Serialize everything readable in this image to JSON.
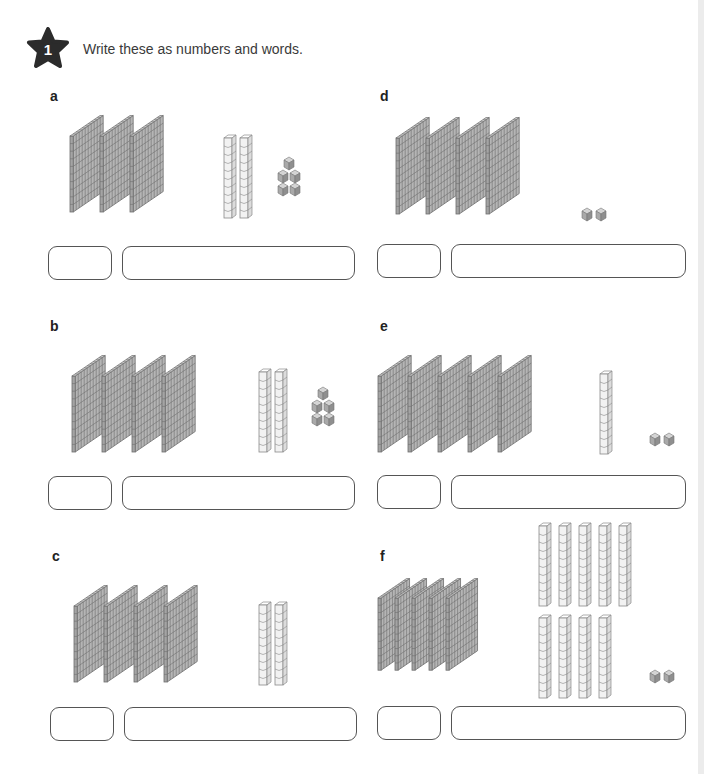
{
  "header": {
    "question_number": "1",
    "instruction": "Write these as numbers and words."
  },
  "colors": {
    "flat_fill": "#b5b5b5",
    "flat_line": "#6e6e6e",
    "rod_fill": "#f2f2f2",
    "rod_line": "#8a8a8a",
    "unit_fill": "#a9a9a9",
    "box_border": "#555555"
  },
  "problems": [
    {
      "id": "a",
      "label": "a",
      "hundreds": 3,
      "tens": 2,
      "ones": 5,
      "number_answer": "",
      "words_answer": ""
    },
    {
      "id": "b",
      "label": "b",
      "hundreds": 4,
      "tens": 2,
      "ones": 5,
      "number_answer": "",
      "words_answer": ""
    },
    {
      "id": "c",
      "label": "c",
      "hundreds": 4,
      "tens": 2,
      "ones": 0,
      "number_answer": "",
      "words_answer": ""
    },
    {
      "id": "d",
      "label": "d",
      "hundreds": 4,
      "tens": 0,
      "ones": 2,
      "number_answer": "",
      "words_answer": ""
    },
    {
      "id": "e",
      "label": "e",
      "hundreds": 5,
      "tens": 1,
      "ones": 2,
      "number_answer": "",
      "words_answer": ""
    },
    {
      "id": "f",
      "label": "f",
      "hundreds": 5,
      "tens": 9,
      "ones": 2,
      "number_answer": "",
      "words_answer": ""
    }
  ]
}
